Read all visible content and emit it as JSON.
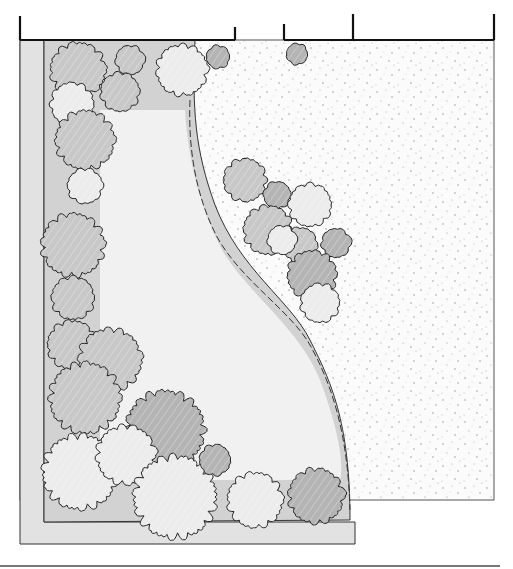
{
  "diagram": {
    "type": "landscape-garden-plan",
    "colors": {
      "background": "#ffffff",
      "ink": "#222222",
      "border_strip": "#e2e2e2",
      "bed_fill": "#d2d2d2",
      "lawn": "#f1f1f1",
      "gravel": "#fbfbfb",
      "shrub_dark": "#b4b4b4",
      "shrub_mid": "#c8c8c8",
      "shrub_light": "#ececec",
      "stipple": "#8a8a8a",
      "ground_line": "#777777"
    },
    "fence": {
      "segments": [
        {
          "x1": 20,
          "y1": 40,
          "x2": 235,
          "y2": 40
        },
        {
          "x1": 284,
          "y1": 40,
          "x2": 353,
          "y2": 40
        },
        {
          "x1": 353,
          "y1": 40,
          "x2": 494,
          "y2": 40
        }
      ],
      "posts": [
        {
          "x": 20,
          "y1": 16,
          "y2": 40
        },
        {
          "x": 235,
          "y1": 27,
          "y2": 40
        },
        {
          "x": 284,
          "y1": 24,
          "y2": 40
        },
        {
          "x": 353,
          "y1": 14,
          "y2": 40
        },
        {
          "x": 494,
          "y1": 14,
          "y2": 40
        }
      ]
    },
    "shrubs": [
      {
        "cx": 78,
        "cy": 70,
        "r": 28,
        "shade": "mid"
      },
      {
        "cx": 130,
        "cy": 60,
        "r": 15,
        "shade": "mid"
      },
      {
        "cx": 182,
        "cy": 70,
        "r": 26,
        "shade": "light"
      },
      {
        "cx": 120,
        "cy": 92,
        "r": 20,
        "shade": "mid"
      },
      {
        "cx": 218,
        "cy": 57,
        "r": 12,
        "shade": "dark"
      },
      {
        "cx": 297,
        "cy": 54,
        "r": 11,
        "shade": "dark"
      },
      {
        "cx": 72,
        "cy": 104,
        "r": 22,
        "shade": "light"
      },
      {
        "cx": 85,
        "cy": 140,
        "r": 30,
        "shade": "mid"
      },
      {
        "cx": 85,
        "cy": 186,
        "r": 18,
        "shade": "light"
      },
      {
        "cx": 73,
        "cy": 245,
        "r": 32,
        "shade": "mid"
      },
      {
        "cx": 73,
        "cy": 298,
        "r": 22,
        "shade": "mid"
      },
      {
        "cx": 72,
        "cy": 345,
        "r": 25,
        "shade": "mid"
      },
      {
        "cx": 110,
        "cy": 360,
        "r": 32,
        "shade": "mid"
      },
      {
        "cx": 85,
        "cy": 398,
        "r": 36,
        "shade": "mid"
      },
      {
        "cx": 165,
        "cy": 430,
        "r": 40,
        "shade": "dark"
      },
      {
        "cx": 80,
        "cy": 472,
        "r": 38,
        "shade": "light"
      },
      {
        "cx": 126,
        "cy": 455,
        "r": 30,
        "shade": "light"
      },
      {
        "cx": 175,
        "cy": 497,
        "r": 42,
        "shade": "light"
      },
      {
        "cx": 215,
        "cy": 460,
        "r": 16,
        "shade": "dark"
      },
      {
        "cx": 255,
        "cy": 500,
        "r": 28,
        "shade": "light"
      },
      {
        "cx": 316,
        "cy": 496,
        "r": 28,
        "shade": "dark"
      },
      {
        "cx": 245,
        "cy": 180,
        "r": 22,
        "shade": "mid"
      },
      {
        "cx": 277,
        "cy": 195,
        "r": 14,
        "shade": "dark"
      },
      {
        "cx": 310,
        "cy": 205,
        "r": 22,
        "shade": "light"
      },
      {
        "cx": 268,
        "cy": 230,
        "r": 25,
        "shade": "mid"
      },
      {
        "cx": 300,
        "cy": 245,
        "r": 18,
        "shade": "mid"
      },
      {
        "cx": 282,
        "cy": 240,
        "r": 15,
        "shade": "light"
      },
      {
        "cx": 336,
        "cy": 243,
        "r": 15,
        "shade": "dark"
      },
      {
        "cx": 312,
        "cy": 275,
        "r": 25,
        "shade": "dark"
      },
      {
        "cx": 320,
        "cy": 303,
        "r": 20,
        "shade": "light"
      }
    ]
  }
}
